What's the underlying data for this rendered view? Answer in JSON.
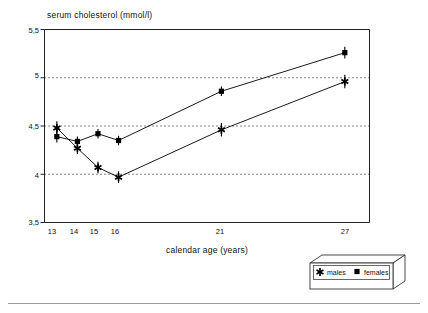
{
  "chart_data": {
    "type": "line",
    "title": "serum cholesterol (mmol/l)",
    "xlabel": "calendar age (years)",
    "ylabel": "serum cholesterol (mmol/l)",
    "categories": [
      "13",
      "14",
      "15",
      "16",
      "21",
      "27"
    ],
    "x": [
      13,
      14,
      15,
      16,
      21,
      27
    ],
    "xlim": [
      12.4,
      28.2
    ],
    "ylim": [
      3.5,
      5.5
    ],
    "yticks": [
      "3,5",
      "4",
      "4,5",
      "5",
      "5,5"
    ],
    "ytick_values": [
      3.5,
      4.0,
      4.5,
      5.0,
      5.5
    ],
    "xticks": [
      "13",
      "14",
      "15",
      "16",
      "21",
      "27"
    ],
    "grid": "horizontal-dotted",
    "gridlines": [
      4.0,
      4.5,
      5.0
    ],
    "legend_position": "bottom-right-outside",
    "error_bars": true,
    "series": [
      {
        "name": "males",
        "marker": "asterisk",
        "color": "#000000",
        "values": [
          4.48,
          4.27,
          4.07,
          3.97,
          4.46,
          4.96
        ],
        "errors": [
          0.07,
          0.06,
          0.06,
          0.06,
          0.07,
          0.07
        ]
      },
      {
        "name": "females",
        "marker": "filled-square",
        "color": "#000000",
        "values": [
          4.39,
          4.34,
          4.42,
          4.35,
          4.86,
          5.26
        ],
        "errors": [
          0.06,
          0.05,
          0.05,
          0.05,
          0.05,
          0.06
        ]
      }
    ]
  },
  "legend": {
    "items": [
      {
        "label": "males",
        "marker": "asterisk"
      },
      {
        "label": "females",
        "marker": "filled-square"
      }
    ]
  },
  "axis": {
    "y_label_text": "serum cholesterol (mmol/l)",
    "x_label_text": "calendar age (years)"
  }
}
